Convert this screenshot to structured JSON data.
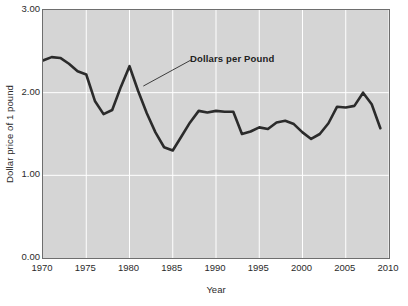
{
  "chart_data": {
    "type": "line",
    "title": "",
    "subtitle": "",
    "xlabel": "Year",
    "ylabel": "Dollar price of 1 pound",
    "xlim": [
      1970,
      2010
    ],
    "ylim": [
      0.0,
      3.0
    ],
    "xticks": [
      1970,
      1975,
      1980,
      1985,
      1990,
      1995,
      2000,
      2005,
      2010
    ],
    "xtick_labels": [
      "1970",
      "1975",
      "1980",
      "1985",
      "1990",
      "1995",
      "2000",
      "2005",
      "2010"
    ],
    "yticks": [
      0.0,
      1.0,
      2.0,
      3.0
    ],
    "ytick_labels": [
      "0.00",
      "1.00",
      "2.00",
      "3.00"
    ],
    "grid": "both-axes-white-gridlines",
    "legend": "none",
    "plot_background_color": "#d5d5d5",
    "gridline_color": "#ffffff",
    "line_color": "#2b2b2b",
    "line_width": 2.6,
    "annotations": [
      {
        "text": "Dollars per Pound",
        "points_to_year": 1981.6,
        "points_to_value": 2.08
      }
    ],
    "series": [
      {
        "name": "Dollars per Pound",
        "x": [
          1970,
          1971,
          1972,
          1973,
          1974,
          1975,
          1976,
          1977,
          1978,
          1979,
          1980,
          1981,
          1982,
          1983,
          1984,
          1985,
          1986,
          1987,
          1988,
          1989,
          1990,
          1991,
          1992,
          1993,
          1994,
          1995,
          1996,
          1997,
          1998,
          1999,
          2000,
          2001,
          2002,
          2003,
          2004,
          2005,
          2006,
          2007,
          2008,
          2009
        ],
        "values": [
          2.39,
          2.43,
          2.42,
          2.35,
          2.26,
          2.22,
          1.9,
          1.74,
          1.79,
          2.07,
          2.32,
          2.02,
          1.75,
          1.52,
          1.34,
          1.3,
          1.47,
          1.64,
          1.78,
          1.76,
          1.78,
          1.77,
          1.77,
          1.5,
          1.53,
          1.58,
          1.56,
          1.64,
          1.66,
          1.62,
          1.52,
          1.44,
          1.5,
          1.63,
          1.83,
          1.82,
          1.84,
          2.0,
          1.86,
          1.57
        ]
      }
    ]
  }
}
